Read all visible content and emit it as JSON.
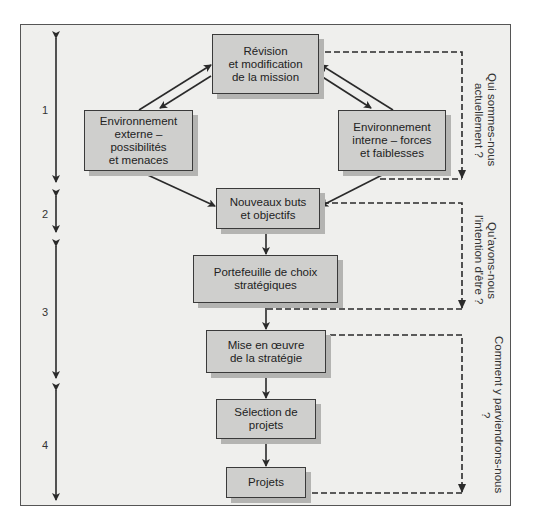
{
  "diagram": {
    "boxes": {
      "revision": "Révision\net modification\nde la mission",
      "externe": "Environnement\nexterne – possibilités\net menaces",
      "interne": "Environnement\ninterne – forces\net faiblesses",
      "buts": "Nouveaux buts\net objectifs",
      "portefeuille": "Portefeuille de choix\nstratégiques",
      "mise": "Mise en œuvre\nde la stratégie",
      "selection": "Sélection de projets",
      "projets": "Projets"
    },
    "steps": [
      "1",
      "2",
      "3",
      "4"
    ],
    "questions": {
      "q1": "Qui sommes-nous\nactuellement ?",
      "q2": "Qu'avons-nous\nl'intention d'être ?",
      "q3": "Comment y parviendrons-nous ?"
    },
    "colors": {
      "box_fill": "#cfcfcd",
      "box_shadow": "#b4b4b2",
      "background": "#efefed",
      "line": "#2a2a2a"
    }
  }
}
